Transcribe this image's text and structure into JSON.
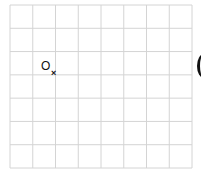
{
  "diagram": {
    "type": "square-grid",
    "columns": 8,
    "rows": 7,
    "grid_color": "#d4d4d4",
    "background": "#ffffff",
    "bounds": {
      "left": 10,
      "top": 5,
      "right": 192,
      "bottom": 168
    },
    "point": {
      "label": "O",
      "marker": "×",
      "label_pos": {
        "x": 41,
        "y": 60
      },
      "marker_pos": {
        "x": 51,
        "y": 69
      }
    },
    "partial_shape_right_edge": "("
  }
}
